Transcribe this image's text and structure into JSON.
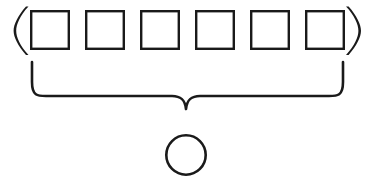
{
  "diagram": {
    "background_color": "#ffffff",
    "stroke_color": "#1a1a1a",
    "canvas": {
      "width": 372,
      "height": 182
    },
    "tuple_group": {
      "name": "parenthesized-box-row",
      "open_paren": {
        "glyph": "(",
        "x": 16,
        "y_top": 6,
        "y_bottom": 55,
        "thickness": 3.2
      },
      "close_paren": {
        "glyph": ")",
        "x": 356,
        "y_top": 6,
        "y_bottom": 55,
        "thickness": 3.2
      },
      "box_count": 6,
      "box_width": 40,
      "box_height": 40,
      "box_gap": 15,
      "box_top": 10,
      "box_stroke_width": 2.4,
      "boxes": [
        {
          "label": "",
          "x": 30,
          "y": 10
        },
        {
          "label": "",
          "x": 85,
          "y": 10
        },
        {
          "label": "",
          "x": 140,
          "y": 10
        },
        {
          "label": "",
          "x": 195,
          "y": 10
        },
        {
          "label": "",
          "x": 250,
          "y": 10
        },
        {
          "label": "",
          "x": 305,
          "y": 10
        }
      ]
    },
    "brace": {
      "orientation": "down",
      "left_x": 32,
      "right_x": 343,
      "top_y": 62,
      "arm_y": 96,
      "tip_x": 186,
      "tip_y": 109,
      "stroke_width": 2.6,
      "corner_radius": 14
    },
    "result_circle": {
      "label": "",
      "center_x": 186,
      "center_y": 155,
      "radius": 21,
      "stroke_width": 2.6
    }
  }
}
